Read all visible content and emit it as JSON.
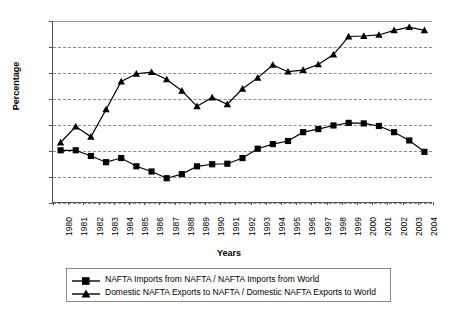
{
  "chart_data": {
    "type": "line",
    "title": "",
    "xlabel": "Years",
    "ylabel": "Percentage",
    "ylim": [
      25,
      60
    ],
    "ytick_labels": [
      "25%",
      "30%",
      "35%",
      "40%",
      "45%",
      "50%",
      "55%",
      "60%"
    ],
    "ytick_values": [
      25,
      30,
      35,
      40,
      45,
      50,
      55,
      60
    ],
    "grid": true,
    "legend_position": "bottom",
    "categories": [
      "1980",
      "1981",
      "1982",
      "1983",
      "1984",
      "1985",
      "1986",
      "1987",
      "1988",
      "1989",
      "1990",
      "1991",
      "1992",
      "1993",
      "1994",
      "1995",
      "1996",
      "1997",
      "1998",
      "1999",
      "2000",
      "2001",
      "2002",
      "2003",
      "2004"
    ],
    "series": [
      {
        "name": "NAFTA Imports from NAFTA / NAFTA Imports from World",
        "marker": "square",
        "color": "#000000",
        "values": [
          35.0,
          35.0,
          33.9,
          32.7,
          33.5,
          31.9,
          30.9,
          29.6,
          30.4,
          31.9,
          32.3,
          32.4,
          33.5,
          35.3,
          36.2,
          36.8,
          38.5,
          39.1,
          39.8,
          40.3,
          40.2,
          39.7,
          38.5,
          36.9,
          34.7
        ]
      },
      {
        "name": "Domestic NAFTA Exports to NAFTA / Domestic NAFTA Exports to World",
        "marker": "triangle",
        "color": "#000000",
        "values": [
          36.5,
          39.6,
          37.6,
          42.9,
          48.3,
          49.8,
          50.1,
          48.7,
          46.5,
          43.5,
          45.2,
          43.9,
          46.9,
          49.0,
          51.5,
          50.2,
          50.5,
          51.6,
          53.5,
          57.0,
          57.1,
          57.3,
          58.2,
          58.8,
          58.2
        ]
      }
    ]
  },
  "legend": {
    "items": [
      {
        "label": "NAFTA Imports from NAFTA / NAFTA Imports from World",
        "marker": "square"
      },
      {
        "label": "Domestic NAFTA Exports to NAFTA / Domestic NAFTA Exports to World",
        "marker": "triangle"
      }
    ]
  }
}
